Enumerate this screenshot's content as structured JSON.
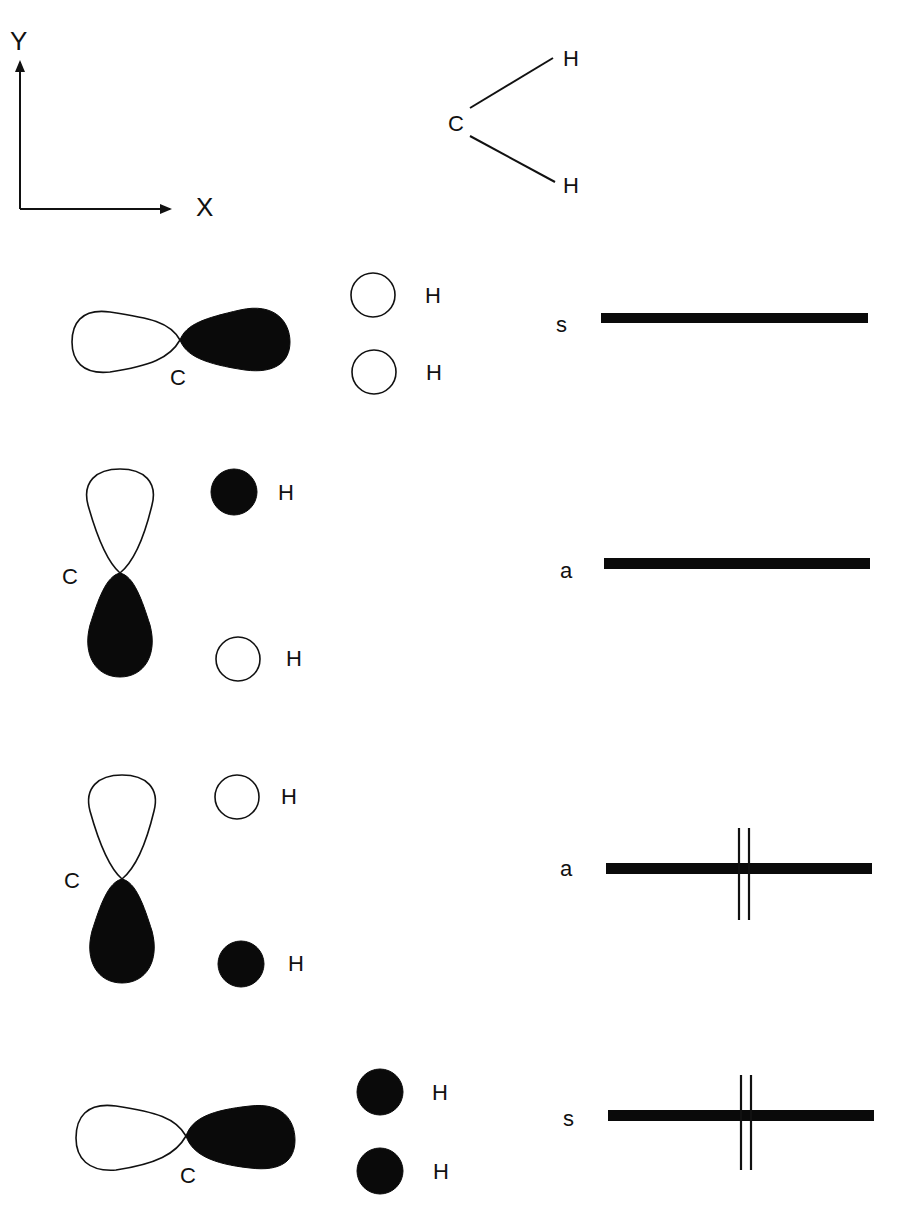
{
  "axes": {
    "y_label": "Y",
    "x_label": "X"
  },
  "molecule": {
    "center": "C",
    "top": "H",
    "bottom": "H"
  },
  "orbitals": [
    {
      "carbon_label": "C",
      "orientation": "horizontal",
      "left_lobe": "open",
      "right_lobe": "filled",
      "h_top": {
        "label": "H",
        "phase": "open"
      },
      "h_bottom": {
        "label": "H",
        "phase": "open"
      },
      "symmetry": "s",
      "electrons": 0
    },
    {
      "carbon_label": "C",
      "orientation": "vertical",
      "top_lobe": "open",
      "bottom_lobe": "filled",
      "h_top": {
        "label": "H",
        "phase": "filled"
      },
      "h_bottom": {
        "label": "H",
        "phase": "open"
      },
      "symmetry": "a",
      "electrons": 0
    },
    {
      "carbon_label": "C",
      "orientation": "vertical",
      "top_lobe": "open",
      "bottom_lobe": "filled",
      "h_top": {
        "label": "H",
        "phase": "open"
      },
      "h_bottom": {
        "label": "H",
        "phase": "filled"
      },
      "symmetry": "a",
      "electrons": 2
    },
    {
      "carbon_label": "C",
      "orientation": "horizontal",
      "left_lobe": "open",
      "right_lobe": "filled",
      "h_top": {
        "label": "H",
        "phase": "filled"
      },
      "h_bottom": {
        "label": "H",
        "phase": "filled"
      },
      "symmetry": "s",
      "electrons": 2
    }
  ]
}
